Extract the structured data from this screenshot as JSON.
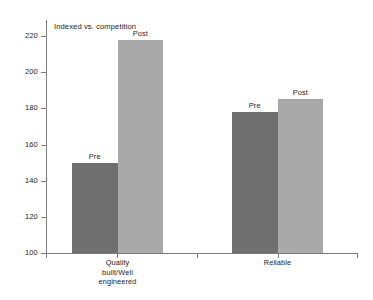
{
  "chart_data": {
    "type": "bar",
    "title": "Indexed vs. competition",
    "xlabel": "",
    "ylabel": "",
    "ylim": [
      100,
      228
    ],
    "yticks": [
      100,
      120,
      140,
      160,
      180,
      200,
      220
    ],
    "grid": false,
    "legend": "none",
    "categories": [
      "Quality built/Well engineered",
      "Reliable"
    ],
    "category_lines": [
      [
        "Quality",
        "built/Well",
        "engineered"
      ],
      [
        "Reliable"
      ]
    ],
    "series": [
      {
        "name": "Pre",
        "values": [
          150,
          178
        ]
      },
      {
        "name": "Post",
        "values": [
          218,
          185
        ]
      }
    ],
    "bar_labels": [
      [
        "Pre",
        "Post"
      ],
      [
        "Pre",
        "Post"
      ]
    ],
    "colors": {
      "pre": "#6f6f6f",
      "post": "#a9a9a9",
      "axis": "#7d7d7d",
      "text": "#1c1c1c",
      "background": "#ffffff"
    }
  },
  "axis": {
    "tick_labels": [
      "220",
      "200",
      "180",
      "160",
      "140",
      "120",
      "100"
    ]
  }
}
